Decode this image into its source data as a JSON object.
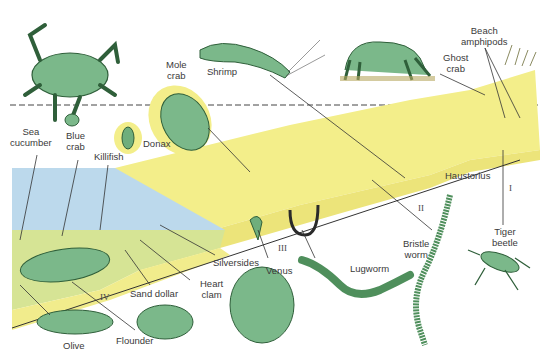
{
  "diagram": {
    "colors": {
      "sand": "#f3ee8a",
      "sand_dark": "#e6de6a",
      "water": "#bcd9ec",
      "subtidal": "#d8e79a",
      "organism": "#6fae7c",
      "organism_dark": "#2f5f3a",
      "line": "#333333"
    },
    "zones": [
      {
        "id": "I",
        "label": "I"
      },
      {
        "id": "II",
        "label": "II"
      },
      {
        "id": "III",
        "label": "III"
      },
      {
        "id": "IV",
        "label": "IV"
      }
    ],
    "labels": {
      "sea_cucumber": "Sea\ncucumber",
      "blue_crab": "Blue\ncrab",
      "killifish": "Killifish",
      "donax": "Donax",
      "mole_crab": "Mole\ncrab",
      "shrimp": "Shrimp",
      "ghost_crab": "Ghost\ncrab",
      "beach_amphipods": "Beach\namphipods",
      "haustorius": "Haustorius",
      "tiger_beetle": "Tiger\nbeetle",
      "bristle_worm": "Bristle\nworm",
      "lugworm": "Lugworm",
      "venus": "Venus",
      "silversides": "Silversides",
      "heart_clam": "Heart\nclam",
      "sand_dollar": "Sand dollar",
      "flounder": "Flounder",
      "olive": "Olive"
    }
  }
}
